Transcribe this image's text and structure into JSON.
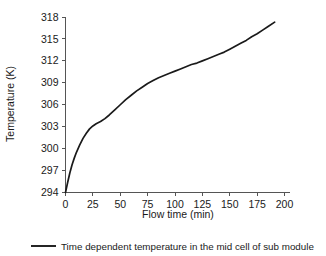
{
  "chart_data": {
    "type": "line",
    "title": "",
    "xlabel": "Flow time (min)",
    "ylabel": "Temperature (K)",
    "xlim": [
      0,
      205
    ],
    "ylim": [
      294,
      318
    ],
    "xticks": [
      0,
      25,
      50,
      75,
      100,
      125,
      150,
      175,
      200
    ],
    "xtick_labels": [
      "0",
      "25",
      "50",
      "75",
      "100",
      "125",
      "150",
      "175",
      "200"
    ],
    "yticks": [
      294,
      297,
      300,
      303,
      306,
      309,
      312,
      315,
      318
    ],
    "ytick_labels": [
      "294",
      "297",
      "300",
      "303",
      "306",
      "309",
      "312",
      "315",
      "318"
    ],
    "grid": false,
    "legend_position": "bottom",
    "series": [
      {
        "name": "Time dependent temperature in the mid cell of sub module",
        "color": "#1a1a1a",
        "x": [
          0,
          2,
          4,
          6,
          8,
          10,
          13,
          16,
          19,
          22,
          25,
          28,
          32,
          36,
          40,
          45,
          50,
          55,
          60,
          65,
          70,
          75,
          80,
          85,
          90,
          95,
          100,
          105,
          110,
          115,
          120,
          125,
          130,
          135,
          140,
          145,
          150,
          155,
          160,
          165,
          170,
          175,
          180,
          185,
          191
        ],
        "y": [
          294.0,
          295.4,
          296.7,
          297.8,
          298.7,
          299.5,
          300.5,
          301.4,
          302.1,
          302.7,
          303.1,
          303.4,
          303.7,
          304.1,
          304.6,
          305.3,
          306.0,
          306.7,
          307.3,
          307.9,
          308.4,
          308.9,
          309.3,
          309.7,
          310.0,
          310.3,
          310.6,
          310.9,
          311.2,
          311.5,
          311.7,
          312.0,
          312.3,
          312.6,
          312.9,
          313.2,
          313.6,
          314.0,
          314.4,
          314.8,
          315.3,
          315.7,
          316.2,
          316.7,
          317.3
        ]
      }
    ]
  },
  "legend": {
    "entries": [
      {
        "label": "Time dependent temperature in the mid cell of sub module",
        "color": "#1a1a1a"
      }
    ]
  },
  "axes": {
    "x_axis_title": "Flow time (min)",
    "y_axis_title": "Temperature (K)"
  }
}
